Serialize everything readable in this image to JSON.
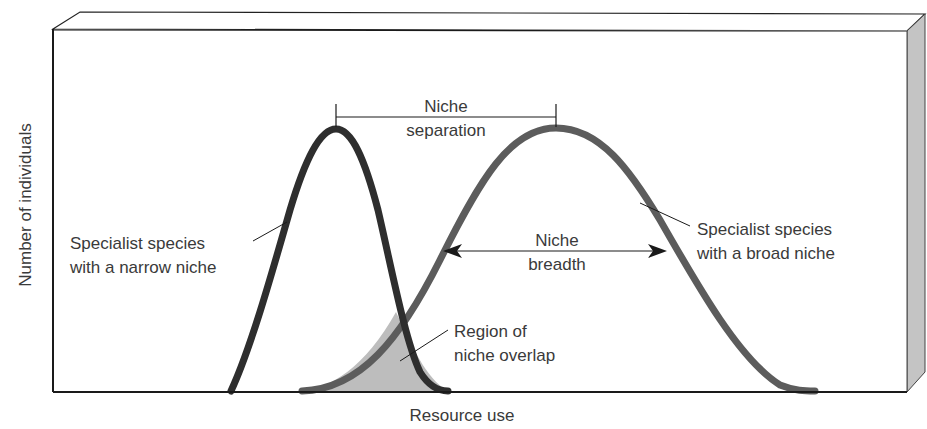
{
  "diagram": {
    "type": "niche-overlap-illustration",
    "axes": {
      "x_label": "Resource use",
      "y_label": "Number of individuals"
    },
    "curves": [
      {
        "id": "narrow",
        "label_line1": "Specialist species",
        "label_line2": "with a narrow niche",
        "color": "#2e2e2e"
      },
      {
        "id": "broad",
        "label_line1": "Specialist species",
        "label_line2": "with a broad niche",
        "color": "#5c5c5c"
      }
    ],
    "annotations": {
      "separation": {
        "line1": "Niche",
        "line2": "separation"
      },
      "breadth": {
        "line1": "Niche",
        "line2": "breadth"
      },
      "overlap": {
        "line1": "Region of",
        "line2": "niche overlap"
      }
    },
    "colors": {
      "overlap_fill": "#bdbdbd",
      "box_side": "#c4c4c4",
      "text": "#3a3a3a"
    }
  }
}
